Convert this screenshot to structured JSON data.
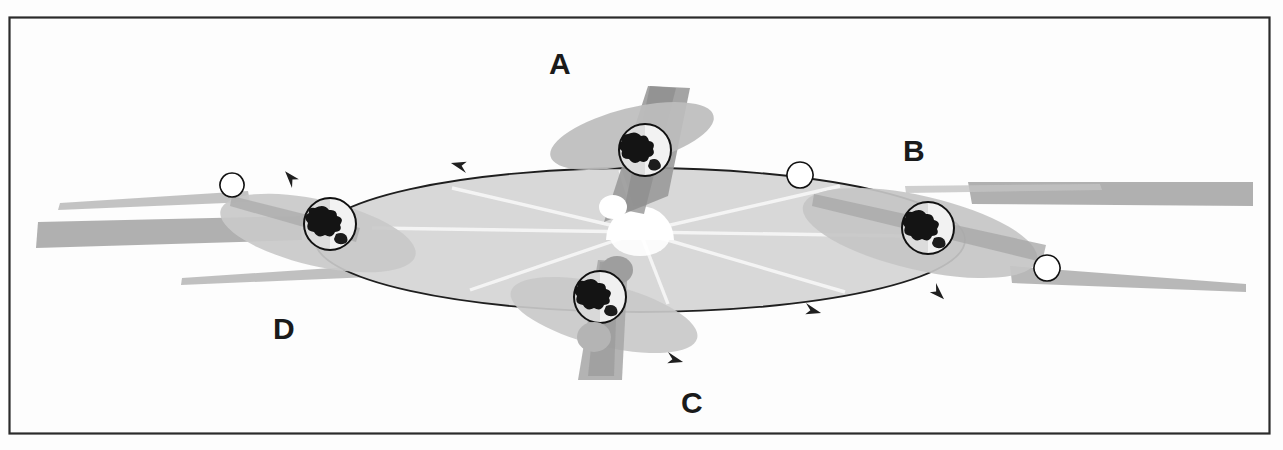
{
  "figure": {
    "border": {
      "color": "#2b2b2b",
      "x": 9,
      "y": 17,
      "width": 1261,
      "height": 417
    },
    "background_color": "#fdfdfd"
  },
  "colors": {
    "orbit_plane_fill": "#d8d8d8",
    "orbit_path_line": "#1f1f1f",
    "shadow_band": "#a9a9a9",
    "shadow_band_light": "#c3c3c3",
    "axis_cone": "#9a9a9a",
    "earth_outline": "#111111",
    "earth_lit": "#f2f2f2",
    "earth_land": "#141414",
    "sun_fill": "#ffffff",
    "sun_ray": "#f4f4f4",
    "label_color": "#1a1a1a"
  },
  "sun": {
    "name": "Sun",
    "cx": 640,
    "cy": 232,
    "r": 34,
    "rays": 8
  },
  "orbit": {
    "cx": 640,
    "cy": 240,
    "rx": 325,
    "ry": 72,
    "direction": "counterclockwise-as-drawn",
    "arrow_count": 4,
    "arrows": [
      {
        "name": "orbit-arrow-top-left",
        "x": 462,
        "y": 174,
        "angle": 186
      },
      {
        "name": "orbit-arrow-bottom-right",
        "x": 818,
        "y": 307,
        "angle": 6
      },
      {
        "name": "orbit-arrow-right",
        "x": 944,
        "y": 283,
        "angle": 36
      },
      {
        "name": "orbit-arrow-left",
        "x": 285,
        "y": 184,
        "angle": 214
      }
    ]
  },
  "positions": [
    {
      "id": "A",
      "label": "A",
      "label_x": 549,
      "label_y": 49,
      "earth_cx": 645,
      "earth_cy": 150,
      "earth_r": 26,
      "terminator": "left-lit",
      "ring_rx": 84,
      "ring_ry": 28,
      "ring_rot": -14,
      "pole_cap_cx": 612,
      "pole_cap_cy": 206
    },
    {
      "id": "B",
      "label": "B",
      "label_x": 903,
      "label_y": 136,
      "earth_cx": 928,
      "earth_cy": 228,
      "earth_r": 26,
      "terminator": "left-lit",
      "ring_rx": 118,
      "ring_ry": 36,
      "ring_rot": 13,
      "pole_cap_cx": 811,
      "pole_cap_cy": 199
    },
    {
      "id": "C",
      "label": "C",
      "label_x": 681,
      "label_y": 388,
      "earth_cx": 600,
      "earth_cy": 297,
      "earth_r": 26,
      "terminator": "left-lit",
      "ring_rx": 86,
      "ring_ry": 29,
      "ring_rot": 14,
      "pole_cap_cx": 617,
      "pole_cap_cy": 270
    },
    {
      "id": "D",
      "label": "D",
      "label_x": 273,
      "label_y": 314,
      "earth_cx": 330,
      "earth_cy": 224,
      "earth_r": 26,
      "terminator": "right-lit",
      "ring_rx": 98,
      "ring_ry": 32,
      "ring_rot": 13,
      "pole_cap_cx": 232,
      "pole_cap_cy": 197
    }
  ],
  "shadow_bands": [
    {
      "name": "shadow-band-D-upper",
      "from_x": 232,
      "from_y": 196,
      "to_x": 40,
      "to_y": 209
    },
    {
      "name": "shadow-band-D-lower",
      "from_x": 300,
      "from_y": 236,
      "to_x": 35,
      "to_y": 228
    },
    {
      "name": "shadow-band-D-far-lower",
      "from_x": 360,
      "from_y": 270,
      "to_x": 180,
      "to_y": 282
    },
    {
      "name": "shadow-band-B-upper",
      "from_x": 1000,
      "from_y": 192,
      "to_x": 1255,
      "to_y": 192
    },
    {
      "name": "shadow-band-B-lower",
      "from_x": 1010,
      "from_y": 248,
      "to_x": 1248,
      "to_y": 283
    }
  ],
  "accessibility": {
    "alt": "Diagram of Earth at four positions (A, B, C, D) around its elliptical orbit about the Sun, with the tilted rotation axis and day/night terminator shown at each position."
  }
}
